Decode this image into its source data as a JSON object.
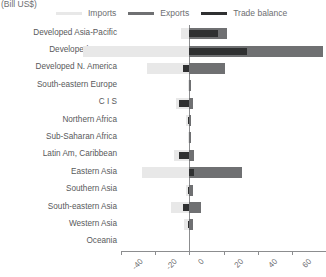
{
  "unit_label": "(Bill US$)",
  "legend": {
    "entries": [
      {
        "label": "Imports",
        "color": "#e8e8e8"
      },
      {
        "label": "Exports",
        "color": "#6f7072"
      },
      {
        "label": "Trade balance",
        "color": "#2f3031"
      }
    ]
  },
  "chart_data": {
    "type": "bar",
    "orientation": "horizontal",
    "title": "",
    "subtitle": "",
    "xlabel": "(Bill US$)",
    "ylabel": "",
    "xlim": [
      -40,
      80
    ],
    "xticks": [
      -40,
      -20,
      0,
      20,
      40,
      60,
      80
    ],
    "xtick_labels": [
      "-40",
      "-20",
      "0",
      "20",
      "40",
      "60",
      "80"
    ],
    "grid": false,
    "legend_position": "top",
    "categories": [
      "Developed Asia-Pacific",
      "Developed Europe",
      "Developed N. America",
      "South-eastern Europe",
      "C I S",
      "Northern Africa",
      "Sub-Saharan Africa",
      "Latin Am, Caribbean",
      "Eastern Asia",
      "Southern Asia",
      "South-eastern Asia",
      "Western Asia",
      "Oceania"
    ],
    "series": [
      {
        "name": "Imports",
        "color": "#e8e8e8",
        "values": [
          -5,
          -62,
          -25,
          -1,
          -8,
          -2,
          -1,
          -9,
          -28,
          -2,
          -11,
          -3,
          0
        ]
      },
      {
        "name": "Exports",
        "color": "#6f7072",
        "values": [
          22,
          78,
          21,
          1,
          2,
          1,
          1,
          3,
          31,
          2,
          7,
          2,
          0
        ]
      },
      {
        "name": "Trade balance",
        "color": "#2f3031",
        "values": [
          17,
          34,
          -4,
          0,
          -6,
          -1,
          0,
          -6,
          3,
          -1,
          -4,
          -1,
          0
        ]
      }
    ]
  }
}
